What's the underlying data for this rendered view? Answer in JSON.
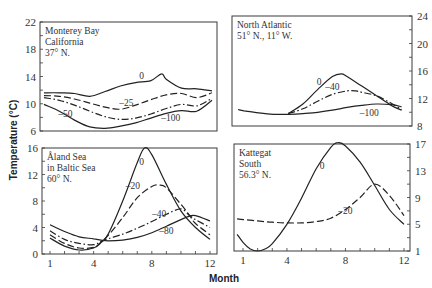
{
  "chart_data": [
    {
      "type": "line",
      "title": [
        "Monterey Bay",
        "California",
        "37° N."
      ],
      "xlabel": "Month",
      "ylabel": "Temperature (°C)",
      "xlim": [
        1,
        12
      ],
      "ylim": [
        6,
        22
      ],
      "yticks": [
        6,
        10,
        14,
        18,
        22
      ],
      "ytick_labels": [
        "6",
        "10",
        "14",
        "18",
        "22"
      ],
      "yaxis_side": "left",
      "xticks": [],
      "series": [
        {
          "name": "0",
          "style": "solid",
          "x": [
            1,
            2,
            3,
            4,
            5,
            6,
            7,
            8,
            8.7,
            9,
            10,
            11,
            12
          ],
          "y": [
            11.6,
            11.6,
            11.5,
            11.1,
            11.8,
            12.6,
            13.1,
            13.4,
            14.4,
            13.6,
            12.3,
            12.2,
            11.9
          ]
        },
        {
          "name": "-25",
          "style": "dashed",
          "x": [
            1,
            2,
            3,
            4,
            5,
            6,
            7,
            8,
            9,
            10,
            11,
            12
          ],
          "y": [
            11.2,
            11.1,
            10.7,
            10.1,
            9.5,
            9.2,
            9.8,
            10.6,
            11.3,
            11.5,
            10.9,
            11.6
          ]
        },
        {
          "name": "-50",
          "style": "dashdot",
          "x": [
            1,
            2,
            3,
            4,
            5,
            6,
            7,
            8,
            9,
            10,
            11,
            12
          ],
          "y": [
            10.9,
            10.5,
            9.8,
            8.9,
            8.1,
            7.7,
            7.9,
            8.5,
            9.3,
            9.9,
            9.7,
            10.8
          ]
        },
        {
          "name": "-100",
          "style": "solid",
          "x": [
            1,
            2,
            3,
            4,
            5,
            6,
            7,
            8,
            9,
            10,
            11,
            12
          ],
          "y": [
            9.9,
            8.9,
            7.6,
            6.6,
            6.4,
            6.7,
            7.2,
            7.9,
            8.6,
            9.0,
            8.9,
            10.5
          ]
        }
      ],
      "annotations": [
        {
          "text": "0",
          "x": 7.4,
          "y": 13.6
        },
        {
          "text": "–25",
          "x": 6.4,
          "y": 9.7
        },
        {
          "text": "–50",
          "x": 2.4,
          "y": 8.0
        },
        {
          "text": "–100",
          "x": 9.3,
          "y": 7.4
        }
      ]
    },
    {
      "type": "line",
      "title": [
        "North Atlantic",
        "51° N., 11° W."
      ],
      "xlim": [
        1,
        12
      ],
      "ylim": [
        8,
        24
      ],
      "yticks": [
        8,
        12,
        16,
        20,
        24
      ],
      "ytick_labels": [
        "8",
        "12",
        "16",
        "20",
        "24"
      ],
      "yaxis_side": "right",
      "xticks": [],
      "series": [
        {
          "name": "0",
          "style": "solid",
          "x": [
            4,
            5,
            6,
            7,
            7.6,
            8,
            9,
            10,
            11,
            11.7
          ],
          "y": [
            9.8,
            11.2,
            13.3,
            15.2,
            15.6,
            15.2,
            13.8,
            12.4,
            11.0,
            10.3
          ]
        },
        {
          "name": "-40",
          "style": "dashdot",
          "x": [
            4,
            5,
            6,
            7,
            8,
            8.6,
            9,
            10,
            11,
            11.7
          ],
          "y": [
            9.8,
            10.5,
            11.6,
            12.6,
            13.1,
            13.1,
            12.9,
            12.4,
            11.3,
            10.4
          ]
        },
        {
          "name": "-100",
          "style": "solid",
          "x": [
            0.6,
            1,
            2,
            3,
            4,
            5,
            6,
            7,
            8,
            9,
            10,
            11,
            11.7
          ],
          "y": [
            10.4,
            10.2,
            9.9,
            9.7,
            9.7,
            9.8,
            10.0,
            10.3,
            10.7,
            11.0,
            11.2,
            11.1,
            10.8
          ]
        }
      ],
      "annotations": [
        {
          "text": "0",
          "x": 6.1,
          "y": 14.0
        },
        {
          "text": "–40",
          "x": 7.0,
          "y": 13.2
        },
        {
          "text": "–100",
          "x": 9.5,
          "y": 9.4
        }
      ]
    },
    {
      "type": "line",
      "title": [
        "Åland Sea",
        "in Baltic Sea",
        "60° N."
      ],
      "xlim": [
        1,
        12
      ],
      "ylim": [
        0,
        16
      ],
      "yticks": [
        0,
        4,
        8,
        12,
        16
      ],
      "ytick_labels": [
        "0",
        "4",
        "8",
        "12",
        "16"
      ],
      "yaxis_side": "left",
      "xticks": [
        1,
        4,
        8,
        12
      ],
      "xtick_labels": [
        "1",
        "4",
        "8",
        "12"
      ],
      "series": [
        {
          "name": "0",
          "style": "solid",
          "x": [
            1,
            2,
            3,
            4,
            4.5,
            5,
            6,
            7,
            7.5,
            8,
            9,
            10,
            11,
            12
          ],
          "y": [
            2.4,
            1.2,
            0.6,
            0.9,
            1.7,
            3.0,
            8.0,
            13.8,
            16.0,
            15.0,
            10.5,
            6.5,
            4.0,
            2.2
          ]
        },
        {
          "name": "-20",
          "style": "dashed",
          "x": [
            1,
            2,
            3,
            4,
            4.5,
            5,
            6,
            7,
            8,
            8.5,
            9,
            10,
            10.6,
            11,
            12
          ],
          "y": [
            2.9,
            1.6,
            0.9,
            1.0,
            1.8,
            2.8,
            5.5,
            8.5,
            10.2,
            10.4,
            10.0,
            7.5,
            5.8,
            4.6,
            2.9
          ]
        },
        {
          "name": "-40",
          "style": "dashdot",
          "x": [
            1,
            2,
            3,
            4,
            4.5,
            5,
            6,
            7,
            8,
            9,
            10,
            10.6,
            11,
            12
          ],
          "y": [
            3.5,
            2.2,
            1.6,
            1.4,
            1.9,
            2.3,
            3.0,
            3.9,
            4.9,
            6.0,
            6.8,
            5.8,
            5.2,
            4.0
          ]
        },
        {
          "name": "-80",
          "style": "solid",
          "x": [
            1,
            2,
            3,
            4,
            4.5,
            5,
            6,
            7,
            8,
            9,
            10,
            10.6,
            11,
            12
          ],
          "y": [
            4.4,
            3.4,
            2.6,
            2.3,
            2.1,
            2.0,
            2.1,
            2.5,
            3.2,
            4.2,
            5.2,
            5.7,
            5.8,
            5.0
          ]
        }
      ],
      "annotations": [
        {
          "text": "0",
          "x": 7.3,
          "y": 13.5
        },
        {
          "text": "–20",
          "x": 6.7,
          "y": 9.8
        },
        {
          "text": "–40",
          "x": 8.5,
          "y": 5.6
        },
        {
          "text": "–80",
          "x": 9.0,
          "y": 3.0
        }
      ]
    },
    {
      "type": "line",
      "title": [
        "Kattegat",
        "South",
        "56.3° N."
      ],
      "xlim": [
        1,
        12
      ],
      "ylim": [
        1,
        17
      ],
      "yticks": [
        1,
        5,
        9,
        13,
        17
      ],
      "ytick_labels": [
        "1",
        "5",
        "9",
        "13",
        "17"
      ],
      "yaxis_side": "right",
      "xticks": [
        1,
        4,
        8,
        12
      ],
      "xtick_labels": [
        "1",
        "4",
        "8",
        "12"
      ],
      "series": [
        {
          "name": "0",
          "style": "solid",
          "x": [
            0.6,
            1,
            1.5,
            2,
            2.5,
            3,
            4,
            5,
            6,
            7,
            7.5,
            8,
            9,
            10,
            11,
            12
          ],
          "y": [
            3.5,
            2.3,
            1.3,
            1.0,
            1.3,
            2.1,
            5.0,
            8.9,
            13.3,
            16.5,
            17.2,
            16.7,
            14.3,
            10.8,
            7.2,
            5.0
          ]
        },
        {
          "name": "-20",
          "style": "dashed",
          "x": [
            0.6,
            1,
            2,
            3,
            4,
            5,
            6,
            7,
            8,
            9,
            10,
            11,
            12
          ],
          "y": [
            5.8,
            5.7,
            5.5,
            5.3,
            5.2,
            5.2,
            5.4,
            5.9,
            7.2,
            9.0,
            11.0,
            9.3,
            6.3
          ]
        }
      ],
      "annotations": [
        {
          "text": "0",
          "x": 6.4,
          "y": 13.2
        },
        {
          "text": "–20",
          "x": 8.0,
          "y": 6.6
        }
      ]
    }
  ],
  "axis": {
    "xlabel": "Month",
    "ylabel": "Temperature (°C)"
  }
}
